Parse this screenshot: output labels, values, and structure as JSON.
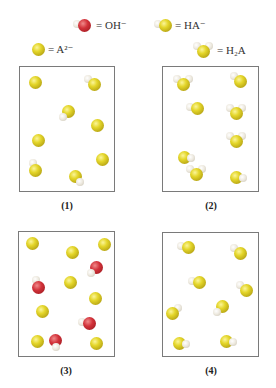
{
  "legend": {
    "items": [
      {
        "id": "oh",
        "symbol_html": "= OH<sup>−</sup>",
        "text": "= OH⁻",
        "molecule": "OH-",
        "x": 96,
        "y": 19,
        "icon": {
          "type": "OH",
          "cx": 84,
          "cy": 25
        }
      },
      {
        "id": "ha",
        "text": "= HA⁻",
        "molecule": "HA-",
        "x": 175,
        "y": 19,
        "icon": {
          "type": "HA",
          "cx": 163,
          "cy": 25
        }
      },
      {
        "id": "a2",
        "text": "= A²⁻",
        "molecule": "A2-",
        "x": 48,
        "y": 43,
        "icon": {
          "type": "A",
          "cx": 38,
          "cy": 49
        }
      },
      {
        "id": "h2a",
        "text": "= H₂A",
        "molecule": "H2A",
        "x": 217,
        "y": 44,
        "icon": {
          "type": "H2A",
          "cx": 203,
          "cy": 50
        }
      }
    ]
  },
  "colors": {
    "sulfur_yellow": "#d8c822",
    "oxygen_red": "#c0272d",
    "hydrogen_white": "#eeeae0",
    "box_border": "#7a7a7a"
  },
  "boxes": [
    {
      "label": "(1)",
      "x": 19,
      "y": 66,
      "w": 96,
      "h": 126,
      "label_x": 52,
      "label_y": 200,
      "molecules": [
        {
          "type": "A",
          "cx": 35,
          "cy": 82
        },
        {
          "type": "HA",
          "cx": 94,
          "cy": 84,
          "h": "lt"
        },
        {
          "type": "HA",
          "cx": 68,
          "cy": 111,
          "h": "lb"
        },
        {
          "type": "A",
          "cx": 97,
          "cy": 125
        },
        {
          "type": "A",
          "cx": 38,
          "cy": 140
        },
        {
          "type": "A",
          "cx": 102,
          "cy": 159
        },
        {
          "type": "HA",
          "cx": 35,
          "cy": 170,
          "h": "t"
        },
        {
          "type": "HA",
          "cx": 75,
          "cy": 176,
          "h": "rb"
        }
      ]
    },
    {
      "label": "(2)",
      "x": 162,
      "y": 66,
      "w": 97,
      "h": 126,
      "label_x": 196,
      "label_y": 200,
      "molecules": [
        {
          "type": "H2A",
          "cx": 183,
          "cy": 83
        },
        {
          "type": "HA",
          "cx": 240,
          "cy": 81,
          "h": "lt"
        },
        {
          "type": "HA",
          "cx": 197,
          "cy": 108,
          "h": "l"
        },
        {
          "type": "H2A",
          "cx": 236,
          "cy": 112
        },
        {
          "type": "H2A",
          "cx": 236,
          "cy": 140
        },
        {
          "type": "HA",
          "cx": 184,
          "cy": 157,
          "h": "r"
        },
        {
          "type": "H2A",
          "cx": 196,
          "cy": 173
        },
        {
          "type": "HA",
          "cx": 236,
          "cy": 177,
          "h": "r"
        }
      ]
    },
    {
      "label": "(3)",
      "x": 18,
      "y": 231,
      "w": 97,
      "h": 126,
      "label_x": 51,
      "label_y": 365,
      "molecules": [
        {
          "type": "A",
          "cx": 32,
          "cy": 243
        },
        {
          "type": "A",
          "cx": 72,
          "cy": 252
        },
        {
          "type": "A",
          "cx": 104,
          "cy": 244
        },
        {
          "type": "OH",
          "cx": 96,
          "cy": 267,
          "h": "lb"
        },
        {
          "type": "OH",
          "cx": 38,
          "cy": 287,
          "h": "t"
        },
        {
          "type": "A",
          "cx": 70,
          "cy": 282
        },
        {
          "type": "A",
          "cx": 95,
          "cy": 298
        },
        {
          "type": "A",
          "cx": 42,
          "cy": 311
        },
        {
          "type": "OH",
          "cx": 89,
          "cy": 323,
          "h": "l"
        },
        {
          "type": "A",
          "cx": 37,
          "cy": 341
        },
        {
          "type": "OH",
          "cx": 55,
          "cy": 340,
          "h": "b"
        },
        {
          "type": "A",
          "cx": 96,
          "cy": 343
        }
      ]
    },
    {
      "label": "(4)",
      "x": 162,
      "y": 232,
      "w": 97,
      "h": 125,
      "label_x": 196,
      "label_y": 365,
      "molecules": [
        {
          "type": "HA",
          "cx": 188,
          "cy": 247,
          "h": "l"
        },
        {
          "type": "HA",
          "cx": 240,
          "cy": 253,
          "h": "lt"
        },
        {
          "type": "HA",
          "cx": 199,
          "cy": 282,
          "h": "l"
        },
        {
          "type": "HA",
          "cx": 246,
          "cy": 290,
          "h": "lt"
        },
        {
          "type": "HA",
          "cx": 222,
          "cy": 306,
          "h": "lb"
        },
        {
          "type": "HA",
          "cx": 172,
          "cy": 313,
          "h": "rt"
        },
        {
          "type": "HA",
          "cx": 226,
          "cy": 341,
          "h": "r"
        },
        {
          "type": "HA",
          "cx": 179,
          "cy": 343,
          "h": "r"
        }
      ]
    }
  ]
}
